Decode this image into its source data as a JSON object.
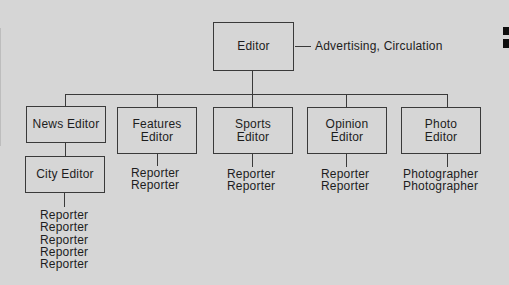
{
  "style": {
    "background_color": "#d6d6d6",
    "line_color": "#3a3a3a",
    "text_color": "#1d1d1d",
    "edge_mark_color": "#0e0e0e"
  },
  "org": {
    "root": {
      "label": "Editor"
    },
    "root_note": "Advertising, Circulation",
    "departments": [
      {
        "id": "news",
        "label": "News Editor",
        "child": {
          "label": "City Editor",
          "staff": [
            "Reporter",
            "Reporter",
            "Reporter",
            "Reporter",
            "Reporter"
          ]
        }
      },
      {
        "id": "features",
        "label": "Features\nEditor",
        "staff": [
          "Reporter",
          "Reporter"
        ]
      },
      {
        "id": "sports",
        "label": "Sports\nEditor",
        "staff": [
          "Reporter",
          "Reporter"
        ]
      },
      {
        "id": "opinion",
        "label": "Opinion\nEditor",
        "staff": [
          "Reporter",
          "Reporter"
        ]
      },
      {
        "id": "photo",
        "label": "Photo\nEditor",
        "staff": [
          "Photographer",
          "Photographer"
        ]
      }
    ]
  }
}
